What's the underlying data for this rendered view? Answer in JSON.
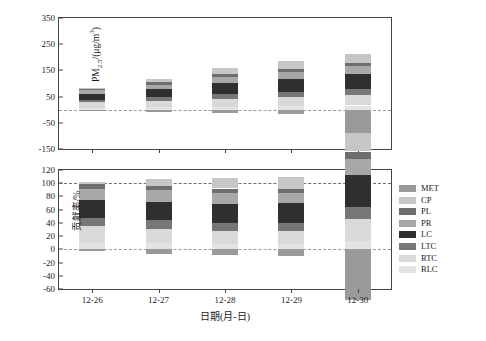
{
  "figure": {
    "xaxis_title": "日期(月-日)",
    "categories": [
      "12-26",
      "12-27",
      "12-28",
      "12-29",
      "12-30"
    ]
  },
  "legend": {
    "position": "right",
    "items": [
      {
        "label": "MET",
        "color": "#9a9a9a"
      },
      {
        "label": "CP",
        "color": "#c6c6c6"
      },
      {
        "label": "PL",
        "color": "#6e6e6e"
      },
      {
        "label": "PR",
        "color": "#a8a8a8"
      },
      {
        "label": "LC",
        "color": "#2f2f2f"
      },
      {
        "label": "LTC",
        "color": "#777777"
      },
      {
        "label": "RTC",
        "color": "#d9d9d9"
      },
      {
        "label": "RLC",
        "color": "#e3e3e3"
      }
    ]
  },
  "chart_data": [
    {
      "type": "bar",
      "id": "pm25-panel",
      "stacked": true,
      "title": "",
      "xlabel": "日期(月-日)",
      "ylabel_html": "PM<sub>2.5</sub>/(μg/m³)",
      "ylabel": "PM2.5/(μg/m³)",
      "ylim": [
        -150,
        350
      ],
      "yticks": [
        -150,
        -50,
        50,
        150,
        250,
        350
      ],
      "grid": false,
      "zero_line": true,
      "categories": [
        "12-26",
        "12-27",
        "12-28",
        "12-29",
        "12-30"
      ],
      "series": [
        {
          "name": "RLC",
          "values": [
            8,
            10,
            12,
            14,
            16
          ]
        },
        {
          "name": "RTC",
          "values": [
            20,
            24,
            30,
            34,
            40
          ]
        },
        {
          "name": "LTC",
          "values": [
            10,
            14,
            18,
            20,
            22
          ]
        },
        {
          "name": "LC",
          "values": [
            22,
            30,
            42,
            50,
            58
          ]
        },
        {
          "name": "PR",
          "values": [
            14,
            18,
            24,
            26,
            30
          ]
        },
        {
          "name": "PL",
          "values": [
            6,
            8,
            10,
            12,
            14
          ]
        },
        {
          "name": "CP",
          "values": [
            2,
            12,
            24,
            30,
            34
          ]
        },
        {
          "name": "MET",
          "values": [
            -2,
            -8,
            -14,
            -18,
            -92
          ]
        }
      ],
      "bar_totals": [
        80,
        108,
        146,
        168,
        122
      ]
    },
    {
      "type": "bar",
      "id": "contribution-panel",
      "stacked": true,
      "title": "",
      "xlabel": "日期(月-日)",
      "ylabel": "贡献率/%",
      "ylim": [
        -60,
        120
      ],
      "yticks": [
        -60,
        -40,
        -20,
        0,
        20,
        40,
        60,
        80,
        100,
        120
      ],
      "grid": false,
      "zero_line": true,
      "reference_line": 100,
      "categories": [
        "12-26",
        "12-27",
        "12-28",
        "12-29",
        "12-30"
      ],
      "series": [
        {
          "name": "RLC",
          "values": [
            10,
            9,
            8,
            8,
            13
          ]
        },
        {
          "name": "RTC",
          "values": [
            25,
            22,
            20,
            20,
            33
          ]
        },
        {
          "name": "LTC",
          "values": [
            12,
            13,
            12,
            12,
            18
          ]
        },
        {
          "name": "LC",
          "values": [
            28,
            28,
            29,
            30,
            48
          ]
        },
        {
          "name": "PR",
          "values": [
            17,
            17,
            16,
            15,
            25
          ]
        },
        {
          "name": "PL",
          "values": [
            7,
            7,
            7,
            7,
            11
          ]
        },
        {
          "name": "CP",
          "values": [
            3,
            11,
            16,
            18,
            28
          ]
        },
        {
          "name": "MET",
          "values": [
            -2,
            -7,
            -8,
            -10,
            -76
          ]
        }
      ]
    }
  ]
}
